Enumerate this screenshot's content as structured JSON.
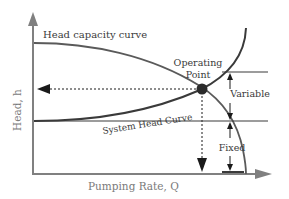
{
  "diagram": {
    "axes": {
      "x_label": "Pumping Rate, Q",
      "y_label": "Head, h"
    },
    "curves": {
      "head_capacity": "Head capacity curve",
      "system_head": "System Head Curve"
    },
    "annotations": {
      "operating_point_line1": "Operating",
      "operating_point_line2": "Point",
      "variable": "Variable",
      "fixed": "Fixed"
    },
    "colors": {
      "axis": "#808080",
      "curve": "#4a4a4a",
      "point": "#2b2b2b",
      "text": "#3a3a3a"
    }
  }
}
